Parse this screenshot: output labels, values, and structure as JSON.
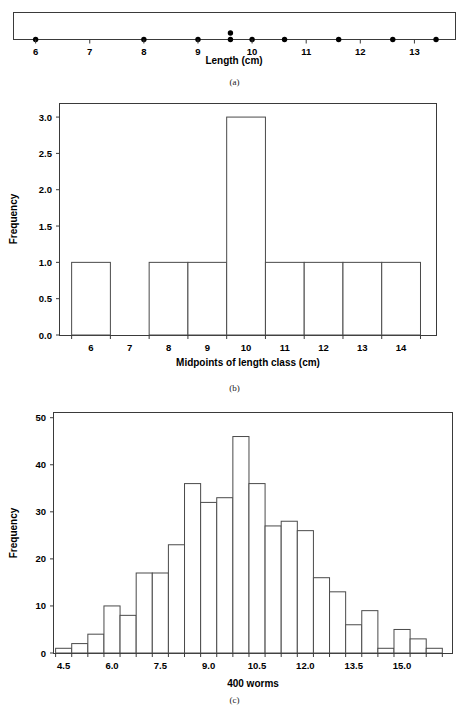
{
  "figure": {
    "panels": [
      {
        "id": "a",
        "caption": "(a)",
        "type": "dotplot",
        "xlabel": "Length (cm)",
        "xticks": [
          6,
          7,
          8,
          9,
          10,
          11,
          12,
          13
        ],
        "xticklabels": [
          "6",
          "7",
          "8",
          "9",
          "10",
          "11",
          "12",
          "13"
        ],
        "xlim": [
          5.6,
          13.75
        ],
        "values": [
          6.0,
          8.0,
          9.0,
          9.6,
          9.6,
          10.0,
          10.6,
          11.6,
          12.6,
          13.4
        ],
        "stacks": [
          {
            "x": 6.0,
            "count": 1
          },
          {
            "x": 8.0,
            "count": 1
          },
          {
            "x": 9.0,
            "count": 1
          },
          {
            "x": 9.6,
            "count": 2
          },
          {
            "x": 10.0,
            "count": 1
          },
          {
            "x": 10.6,
            "count": 1
          },
          {
            "x": 11.6,
            "count": 1
          },
          {
            "x": 12.6,
            "count": 1
          },
          {
            "x": 13.4,
            "count": 1
          }
        ],
        "n": 10
      },
      {
        "id": "b",
        "caption": "(b)",
        "type": "bar",
        "title": "",
        "xlabel": "Midpoints of length class (cm)",
        "ylabel": "Frequency",
        "categories": [
          "6",
          "7",
          "8",
          "9",
          "10",
          "11",
          "12",
          "13",
          "14"
        ],
        "values": [
          1,
          0,
          1,
          1,
          3,
          1,
          1,
          1,
          1
        ],
        "bin_edges": [
          5.5,
          6.5,
          7.5,
          8.5,
          9.5,
          10.5,
          11.5,
          12.5,
          13.5,
          14.5
        ],
        "xticks": [
          6,
          7,
          8,
          9,
          10,
          11,
          12,
          13,
          14
        ],
        "xticklabels": [
          "6",
          "7",
          "8",
          "9",
          "10",
          "11",
          "12",
          "13",
          "14"
        ],
        "yticks": [
          0.0,
          0.5,
          1.0,
          1.5,
          2.0,
          2.5,
          3.0
        ],
        "yticklabels": [
          "0.0",
          "0.5",
          "1.0",
          "1.5",
          "2.0",
          "2.5",
          "3.0"
        ],
        "xlim": [
          5.2,
          14.9
        ],
        "ylim": [
          0,
          3.18
        ],
        "grid": false,
        "legend": "none"
      },
      {
        "id": "c",
        "caption": "(c)",
        "type": "bar",
        "title": "",
        "xlabel": "400 worms",
        "ylabel": "Frequency",
        "bin_width": 0.5,
        "bin_edges": [
          4.25,
          4.75,
          5.25,
          5.75,
          6.25,
          6.75,
          7.25,
          7.75,
          8.25,
          8.75,
          9.25,
          9.75,
          10.25,
          10.75,
          11.25,
          11.75,
          12.25,
          12.75,
          13.25,
          13.75,
          14.25,
          14.75,
          15.25,
          15.75,
          16.25
        ],
        "categories": [
          "4.25-4.75",
          "4.75-5.25",
          "5.25-5.75",
          "5.75-6.25",
          "6.25-6.75",
          "6.75-7.25",
          "7.25-7.75",
          "7.75-8.25",
          "8.25-8.75",
          "8.75-9.25",
          "9.25-9.75",
          "9.75-10.25",
          "10.25-10.75",
          "10.75-11.25",
          "11.25-11.75",
          "11.75-12.25",
          "12.25-12.75",
          "12.75-13.25",
          "13.25-13.75",
          "13.75-14.25",
          "14.25-14.75",
          "14.75-15.25",
          "15.25-15.75",
          "15.75-16.25"
        ],
        "values": [
          1,
          2,
          4,
          10,
          8,
          17,
          17,
          23,
          36,
          32,
          33,
          46,
          36,
          27,
          28,
          26,
          16,
          13,
          6,
          9,
          1,
          5,
          3,
          1
        ],
        "total": 400,
        "xticks": [
          4.5,
          6.0,
          7.5,
          9.0,
          10.5,
          12.0,
          13.5,
          15.0
        ],
        "xticklabels": [
          "4.5",
          "6.0",
          "7.5",
          "9.0",
          "10.5",
          "12.0",
          "13.5",
          "15.0"
        ],
        "yticks": [
          0,
          10,
          20,
          30,
          40,
          50
        ],
        "yticklabels": [
          "0",
          "10",
          "20",
          "30",
          "40",
          "50"
        ],
        "xlim": [
          4.2,
          16.55
        ],
        "ylim": [
          0,
          51
        ],
        "grid": false,
        "legend": "none"
      }
    ]
  },
  "chart_data": [
    {
      "type": "scatter",
      "panel": "a",
      "title": "(a) Dotplot of worm lengths",
      "xlabel": "Length (cm)",
      "ylabel": "",
      "x": [
        6.0,
        8.0,
        9.0,
        9.6,
        9.6,
        10.0,
        10.6,
        11.6,
        12.6,
        13.4
      ],
      "y": [
        1,
        1,
        1,
        1,
        2,
        1,
        1,
        1,
        1,
        1
      ],
      "xlim": [
        5.6,
        13.75
      ],
      "grid": false,
      "legend": "none",
      "tick_labels_x": [
        "6",
        "7",
        "8",
        "9",
        "10",
        "11",
        "12",
        "13"
      ]
    },
    {
      "type": "bar",
      "panel": "b",
      "title": "(b) Histogram of worm lengths",
      "categories": [
        "6",
        "7",
        "8",
        "9",
        "10",
        "11",
        "12",
        "13",
        "14"
      ],
      "values": [
        1,
        0,
        1,
        1,
        3,
        1,
        1,
        1,
        1
      ],
      "xlabel": "Midpoints of length class (cm)",
      "ylabel": "Frequency",
      "ylim": [
        0,
        3.18
      ],
      "xlim": [
        5.2,
        14.9
      ],
      "grid": false,
      "legend": "none",
      "tick_labels_y": [
        "0.0",
        "0.5",
        "1.0",
        "1.5",
        "2.0",
        "2.5",
        "3.0"
      ]
    },
    {
      "type": "bar",
      "panel": "c",
      "title": "(c) Histogram of 400 worms",
      "categories": [
        "4.25-4.75",
        "4.75-5.25",
        "5.25-5.75",
        "5.75-6.25",
        "6.25-6.75",
        "6.75-7.25",
        "7.25-7.75",
        "7.75-8.25",
        "8.25-8.75",
        "8.75-9.25",
        "9.25-9.75",
        "9.75-10.25",
        "10.25-10.75",
        "10.75-11.25",
        "11.25-11.75",
        "11.75-12.25",
        "12.25-12.75",
        "12.75-13.25",
        "13.25-13.75",
        "13.75-14.25",
        "14.25-14.75",
        "14.75-15.25",
        "15.25-15.75",
        "15.75-16.25"
      ],
      "values": [
        1,
        2,
        4,
        10,
        8,
        17,
        17,
        23,
        36,
        32,
        33,
        46,
        36,
        27,
        28,
        26,
        16,
        13,
        6,
        9,
        1,
        5,
        3,
        1
      ],
      "xlabel": "400 worms",
      "ylabel": "Frequency",
      "ylim": [
        0,
        51
      ],
      "xlim": [
        4.2,
        16.55
      ],
      "grid": false,
      "legend": "none",
      "tick_labels_x": [
        "4.5",
        "6.0",
        "7.5",
        "9.0",
        "10.5",
        "12.0",
        "13.5",
        "15.0"
      ],
      "tick_labels_y": [
        "0",
        "10",
        "20",
        "30",
        "40",
        "50"
      ]
    }
  ]
}
